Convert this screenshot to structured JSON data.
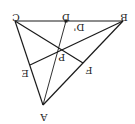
{
  "diagram": {
    "type": "triangle-cevians",
    "orientation": "rotated-180",
    "points": {
      "A": {
        "label": "A",
        "x": 43,
        "y": 105
      },
      "B": {
        "label": "B",
        "x": 123,
        "y": 21
      },
      "C": {
        "label": "C",
        "x": 15,
        "y": 21
      },
      "D": {
        "label": "D",
        "x": 66,
        "y": 21
      },
      "D_prime": {
        "label": "D'",
        "x": 78,
        "y": 27
      },
      "E": {
        "label": "E",
        "x": 30,
        "y": 65
      },
      "F": {
        "label": "F",
        "x": 83,
        "y": 63
      },
      "P": {
        "label": "P",
        "x": 62,
        "y": 50
      }
    },
    "segments": [
      "CB",
      "CA",
      "AB",
      "AD",
      "BE",
      "CF"
    ],
    "colors": {
      "line": "#1a1a1a",
      "text": "#222222",
      "background": "#ffffff"
    }
  }
}
